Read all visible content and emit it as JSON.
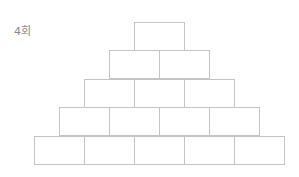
{
  "label": "4회",
  "pyramid": {
    "line_color": "#c4c4c4",
    "rows": [
      {
        "cells": [
          "",
          ""
        ]
      },
      {
        "cells": [
          "",
          "",
          ""
        ]
      },
      {
        "cells": [
          "",
          "",
          "",
          ""
        ]
      },
      {
        "cells": [
          "",
          "",
          "",
          "",
          ""
        ]
      }
    ]
  }
}
